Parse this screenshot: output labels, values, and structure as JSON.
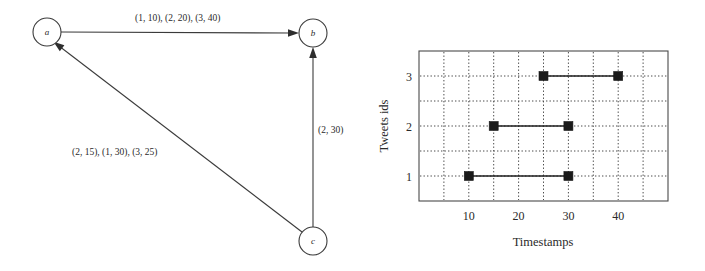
{
  "graph": {
    "nodes": [
      {
        "id": "a",
        "label": "a",
        "cx": 47,
        "cy": 32,
        "r": 14
      },
      {
        "id": "b",
        "label": "b",
        "cx": 313,
        "cy": 33,
        "r": 14
      },
      {
        "id": "c",
        "label": "c",
        "cx": 313,
        "cy": 241,
        "r": 14
      }
    ],
    "edges": [
      {
        "id": "a-to-b",
        "from": "a",
        "to": "b",
        "label": "(1, 10), (2, 20), (3, 40)"
      },
      {
        "id": "c-to-a",
        "from": "c",
        "to": "a",
        "label": "(2, 15), (1, 30), (3, 25)"
      },
      {
        "id": "c-to-b",
        "from": "c",
        "to": "b",
        "label": "(2, 30)"
      }
    ]
  },
  "chart_data": {
    "type": "line",
    "title": "",
    "xlabel": "Timestamps",
    "ylabel": "Tweets ids",
    "xlim": [
      0,
      50
    ],
    "ylim": [
      0.5,
      3.5
    ],
    "grid": true,
    "legend": "none",
    "xticks": [
      10,
      20,
      30,
      40
    ],
    "xtick_labels": [
      "10",
      "20",
      "30",
      "40"
    ],
    "yticks": [
      1,
      2,
      3
    ],
    "ytick_labels": [
      "1",
      "2",
      "3"
    ],
    "x_gridlines": [
      5,
      10,
      15,
      20,
      25,
      30,
      35,
      40,
      45
    ],
    "y_gridlines": [
      1,
      1.5,
      2,
      2.5,
      3
    ],
    "series": [
      {
        "name": "tweet 1",
        "y": 1,
        "x": [
          10,
          30
        ],
        "values": [
          1,
          1
        ]
      },
      {
        "name": "tweet 2",
        "y": 2,
        "x": [
          15,
          30
        ],
        "values": [
          2,
          2
        ]
      },
      {
        "name": "tweet 3",
        "y": 3,
        "x": [
          25,
          40
        ],
        "values": [
          3,
          3
        ]
      }
    ]
  }
}
